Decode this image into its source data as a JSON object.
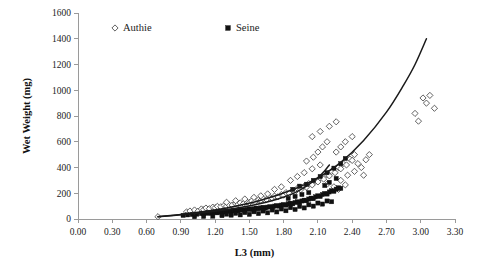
{
  "chart_data": {
    "type": "scatter",
    "title": "",
    "xlabel": "L3 (mm)",
    "ylabel": "Wet Weight (mg)",
    "xlim": [
      0.0,
      3.3
    ],
    "ylim": [
      0,
      1600
    ],
    "xticks": [
      "0.00",
      "0.30",
      "0.60",
      "0.90",
      "1.20",
      "1.50",
      "1.80",
      "2.10",
      "2.40",
      "2.70",
      "3.00",
      "3.30"
    ],
    "yticks": [
      "0",
      "200",
      "400",
      "600",
      "800",
      "1000",
      "1200",
      "1400",
      "1600"
    ],
    "grid": false,
    "legend_position": "top-center",
    "legend": [
      {
        "name": "Authie",
        "marker": "open-diamond",
        "color": "#ffffff",
        "edge_color": "#3a3a3a"
      },
      {
        "name": "Seine",
        "marker": "filled-square",
        "color": "#111111",
        "edge_color": "#111111"
      }
    ],
    "series": [
      {
        "name": "Authie",
        "marker": "open-diamond",
        "points": [
          [
            0.7,
            18
          ],
          [
            0.95,
            55
          ],
          [
            0.98,
            62
          ],
          [
            1.02,
            70
          ],
          [
            1.05,
            60
          ],
          [
            1.08,
            78
          ],
          [
            1.1,
            72
          ],
          [
            1.12,
            85
          ],
          [
            1.15,
            80
          ],
          [
            1.18,
            92
          ],
          [
            1.2,
            88
          ],
          [
            1.22,
            98
          ],
          [
            1.25,
            95
          ],
          [
            1.28,
            105
          ],
          [
            1.3,
            100
          ],
          [
            1.32,
            112
          ],
          [
            1.35,
            108
          ],
          [
            1.38,
            118
          ],
          [
            1.4,
            115
          ],
          [
            1.42,
            125
          ],
          [
            1.45,
            120
          ],
          [
            1.48,
            132
          ],
          [
            1.5,
            128
          ],
          [
            1.52,
            140
          ],
          [
            1.55,
            135
          ],
          [
            1.58,
            148
          ],
          [
            1.6,
            145
          ],
          [
            1.62,
            158
          ],
          [
            1.65,
            152
          ],
          [
            1.68,
            168
          ],
          [
            1.7,
            162
          ],
          [
            1.72,
            178
          ],
          [
            1.75,
            172
          ],
          [
            1.78,
            190
          ],
          [
            1.8,
            185
          ],
          [
            1.82,
            205
          ],
          [
            1.85,
            198
          ],
          [
            1.88,
            220
          ],
          [
            1.9,
            212
          ],
          [
            1.92,
            238
          ],
          [
            1.95,
            228
          ],
          [
            1.98,
            255
          ],
          [
            2.0,
            248
          ],
          [
            2.02,
            275
          ],
          [
            2.05,
            265
          ],
          [
            2.08,
            295
          ],
          [
            2.1,
            288
          ],
          [
            2.12,
            320
          ],
          [
            2.15,
            310
          ],
          [
            2.18,
            345
          ],
          [
            2.2,
            335
          ],
          [
            2.22,
            370
          ],
          [
            2.25,
            360
          ],
          [
            2.28,
            400
          ],
          [
            2.3,
            390
          ],
          [
            2.32,
            430
          ],
          [
            2.35,
            420
          ],
          [
            2.38,
            465
          ],
          [
            2.4,
            455
          ],
          [
            2.42,
            500
          ],
          [
            1.86,
            300
          ],
          [
            1.92,
            330
          ],
          [
            1.98,
            360
          ],
          [
            2.05,
            390
          ],
          [
            2.12,
            420
          ],
          [
            2.0,
            450
          ],
          [
            2.06,
            480
          ],
          [
            2.1,
            520
          ],
          [
            2.14,
            560
          ],
          [
            2.18,
            600
          ],
          [
            2.05,
            640
          ],
          [
            2.12,
            680
          ],
          [
            2.2,
            720
          ],
          [
            2.26,
            755
          ],
          [
            2.26,
            520
          ],
          [
            2.3,
            560
          ],
          [
            2.34,
            600
          ],
          [
            2.4,
            640
          ],
          [
            2.45,
            430
          ],
          [
            2.48,
            400
          ],
          [
            2.52,
            460
          ],
          [
            2.55,
            500
          ],
          [
            2.3,
            300
          ],
          [
            2.36,
            340
          ],
          [
            2.42,
            370
          ],
          [
            2.5,
            340
          ],
          [
            2.18,
            270
          ],
          [
            2.24,
            250
          ],
          [
            2.28,
            230
          ],
          [
            2.34,
            265
          ],
          [
            1.72,
            230
          ],
          [
            1.78,
            250
          ],
          [
            1.66,
            195
          ],
          [
            1.6,
            180
          ],
          [
            1.54,
            168
          ],
          [
            1.46,
            155
          ],
          [
            1.38,
            142
          ],
          [
            1.3,
            130
          ],
          [
            2.95,
            820
          ],
          [
            3.02,
            940
          ],
          [
            3.05,
            900
          ],
          [
            3.08,
            960
          ],
          [
            3.12,
            860
          ],
          [
            2.98,
            760
          ]
        ]
      },
      {
        "name": "Seine",
        "marker": "filled-square",
        "points": [
          [
            0.92,
            28
          ],
          [
            0.96,
            32
          ],
          [
            1.0,
            35
          ],
          [
            1.04,
            38
          ],
          [
            1.08,
            42
          ],
          [
            1.1,
            40
          ],
          [
            1.12,
            45
          ],
          [
            1.14,
            48
          ],
          [
            1.16,
            44
          ],
          [
            1.18,
            50
          ],
          [
            1.2,
            52
          ],
          [
            1.22,
            48
          ],
          [
            1.24,
            55
          ],
          [
            1.26,
            58
          ],
          [
            1.28,
            54
          ],
          [
            1.3,
            60
          ],
          [
            1.32,
            62
          ],
          [
            1.34,
            58
          ],
          [
            1.36,
            65
          ],
          [
            1.38,
            68
          ],
          [
            1.4,
            64
          ],
          [
            1.42,
            70
          ],
          [
            1.44,
            72
          ],
          [
            1.46,
            68
          ],
          [
            1.48,
            75
          ],
          [
            1.5,
            78
          ],
          [
            1.52,
            74
          ],
          [
            1.54,
            80
          ],
          [
            1.56,
            84
          ],
          [
            1.58,
            80
          ],
          [
            1.6,
            86
          ],
          [
            1.62,
            90
          ],
          [
            1.64,
            86
          ],
          [
            1.66,
            92
          ],
          [
            1.68,
            96
          ],
          [
            1.7,
            92
          ],
          [
            1.72,
            100
          ],
          [
            1.74,
            104
          ],
          [
            1.76,
            100
          ],
          [
            1.78,
            108
          ],
          [
            1.8,
            112
          ],
          [
            1.82,
            108
          ],
          [
            1.84,
            118
          ],
          [
            1.86,
            122
          ],
          [
            1.88,
            118
          ],
          [
            1.9,
            128
          ],
          [
            1.92,
            134
          ],
          [
            1.94,
            128
          ],
          [
            1.96,
            140
          ],
          [
            1.98,
            146
          ],
          [
            2.0,
            142
          ],
          [
            2.02,
            155
          ],
          [
            2.04,
            162
          ],
          [
            2.06,
            158
          ],
          [
            2.08,
            172
          ],
          [
            2.1,
            180
          ],
          [
            2.12,
            175
          ],
          [
            2.14,
            190
          ],
          [
            2.16,
            198
          ],
          [
            2.18,
            194
          ],
          [
            2.2,
            210
          ],
          [
            2.22,
            220
          ],
          [
            2.24,
            215
          ],
          [
            2.26,
            232
          ],
          [
            2.28,
            242
          ],
          [
            2.3,
            238
          ],
          [
            1.3,
            38
          ],
          [
            1.38,
            44
          ],
          [
            1.46,
            50
          ],
          [
            1.54,
            56
          ],
          [
            1.62,
            62
          ],
          [
            1.7,
            70
          ],
          [
            1.78,
            78
          ],
          [
            1.86,
            88
          ],
          [
            1.94,
            98
          ],
          [
            2.02,
            110
          ],
          [
            2.1,
            124
          ],
          [
            2.18,
            140
          ],
          [
            1.42,
            32
          ],
          [
            1.5,
            36
          ],
          [
            1.58,
            42
          ],
          [
            1.66,
            48
          ],
          [
            1.74,
            55
          ],
          [
            1.82,
            64
          ],
          [
            1.9,
            74
          ],
          [
            1.98,
            86
          ],
          [
            2.06,
            100
          ],
          [
            2.14,
            116
          ],
          [
            2.22,
            134
          ],
          [
            1.84,
            160
          ],
          [
            1.9,
            175
          ],
          [
            1.96,
            190
          ],
          [
            2.02,
            205
          ],
          [
            1.88,
            230
          ],
          [
            1.94,
            255
          ],
          [
            2.0,
            270
          ],
          [
            2.06,
            300
          ],
          [
            2.12,
            330
          ],
          [
            2.18,
            360
          ],
          [
            2.24,
            395
          ],
          [
            2.3,
            430
          ],
          [
            2.34,
            470
          ],
          [
            2.16,
            260
          ],
          [
            2.2,
            285
          ],
          [
            2.26,
            315
          ],
          [
            1.26,
            26
          ],
          [
            1.34,
            30
          ],
          [
            1.18,
            22
          ],
          [
            1.1,
            20
          ],
          [
            1.02,
            18
          ]
        ]
      }
    ],
    "fit_curves": [
      {
        "name": "Authie fit",
        "points": [
          [
            0.7,
            18
          ],
          [
            1.0,
            45
          ],
          [
            1.3,
            85
          ],
          [
            1.6,
            145
          ],
          [
            1.9,
            235
          ],
          [
            2.1,
            320
          ],
          [
            2.3,
            440
          ],
          [
            2.5,
            610
          ],
          [
            2.7,
            830
          ],
          [
            2.85,
            1040
          ],
          [
            2.95,
            1200
          ],
          [
            3.05,
            1400
          ]
        ]
      },
      {
        "name": "Seine fit",
        "points": [
          [
            0.7,
            18
          ],
          [
            1.0,
            40
          ],
          [
            1.3,
            72
          ],
          [
            1.55,
            110
          ],
          [
            1.75,
            155
          ],
          [
            1.9,
            205
          ],
          [
            2.0,
            255
          ],
          [
            2.1,
            320
          ],
          [
            2.16,
            375
          ],
          [
            2.2,
            420
          ]
        ]
      }
    ]
  }
}
